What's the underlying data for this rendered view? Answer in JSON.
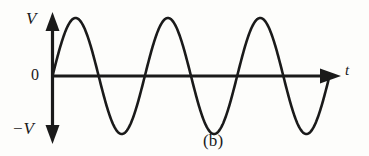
{
  "figure": {
    "caption": "(b)",
    "background_color": "#fdfdfb",
    "ink_color": "#1a1a1a"
  },
  "labels": {
    "y_top": "V",
    "y_zero": "0",
    "y_bottom": "−V",
    "x_axis": "t"
  },
  "chart_data": {
    "type": "line",
    "title": "(b)",
    "xlabel": "t",
    "ylabel": "V",
    "grid": false,
    "legend": null,
    "axis_style": "arrows-both-ends",
    "ytick_labels": [
      "V",
      "0",
      "−V"
    ],
    "ytick_values": [
      1,
      0,
      -1
    ],
    "xtick_labels": [],
    "xlim": [
      0,
      3.5
    ],
    "ylim": [
      -1.15,
      1.15
    ],
    "series": [
      {
        "name": "sinusoidal voltage",
        "waveform": "sine",
        "amplitude": 1,
        "periods": 3,
        "phase_deg": 0,
        "x": [
          0,
          0.125,
          0.25,
          0.375,
          0.5,
          0.625,
          0.75,
          0.875,
          1.0,
          1.125,
          1.25,
          1.375,
          1.5,
          1.625,
          1.75,
          1.875,
          2.0,
          2.125,
          2.25,
          2.375,
          2.5,
          2.625,
          2.75,
          2.875,
          3.0
        ],
        "values": [
          0,
          0.707,
          1.0,
          0.707,
          0,
          -0.707,
          -1.0,
          -0.707,
          0,
          0.707,
          1.0,
          0.707,
          0,
          -0.707,
          -1.0,
          -0.707,
          0,
          0.707,
          1.0,
          0.707,
          0,
          -0.707,
          -1.0,
          -0.707,
          0
        ]
      }
    ]
  }
}
